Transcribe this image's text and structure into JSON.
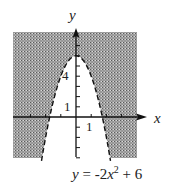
{
  "chart_data": {
    "type": "inequality-region",
    "title": "",
    "equation": {
      "lhs": "y",
      "relation": "=",
      "coef": "-2",
      "var": "x",
      "exponent": "2",
      "const_sign": "+",
      "const": "6",
      "text": "y = -2x^2 + 6"
    },
    "boundary": {
      "function": "-2*x^2+6",
      "style": "dashed",
      "vertex": [
        0,
        6
      ],
      "x_intercepts": [
        -1.732,
        1.732
      ]
    },
    "shaded_region": "outside the parabola (y > -2x^2 + 6)",
    "xlabel": "x",
    "ylabel": "y",
    "xlim": [
      -4.2,
      4.1
    ],
    "ylim": [
      -4,
      8.3
    ],
    "x_ticks": [
      -3,
      -2,
      -1,
      1,
      2,
      3
    ],
    "y_ticks": [
      -4,
      -3,
      -2,
      -1,
      1,
      2,
      3,
      4,
      5,
      6,
      7
    ],
    "tick_labels": {
      "x": {
        "value": 1,
        "label": "1"
      },
      "y": [
        {
          "value": 1,
          "label": "1"
        },
        {
          "value": 4,
          "label": "4"
        }
      ]
    },
    "grid": false,
    "legend": null
  },
  "labels": {
    "x_axis": "x",
    "y_axis": "y",
    "x_tick_1": "1",
    "y_tick_1": "1",
    "y_tick_4": "4"
  },
  "colors": {
    "shade": "#8c8c8c",
    "line": "#111111",
    "background": "#ffffff"
  }
}
